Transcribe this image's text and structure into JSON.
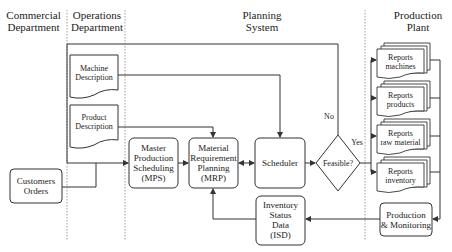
{
  "headers": {
    "commercial": [
      "Commercial",
      "Department"
    ],
    "operations": [
      "Operations",
      "Department"
    ],
    "planning": [
      "Planning",
      "System"
    ],
    "production": [
      "Production",
      "Plant"
    ]
  },
  "documents": {
    "machine": [
      "Machine",
      "Description"
    ],
    "product": [
      "Product",
      "Description"
    ]
  },
  "boxes": {
    "customers": [
      "Customers",
      "Orders"
    ],
    "mps": [
      "Master",
      "Production",
      "Scheduling",
      "(MPS)"
    ],
    "mrp": [
      "Material",
      "Requirement",
      "Planning",
      "(MRP)"
    ],
    "scheduler": "Scheduler",
    "isd": [
      "Inventory",
      "Status",
      "Data",
      "(ISD)"
    ],
    "production_monitoring": [
      "Production",
      "& Monitoring"
    ]
  },
  "decision": {
    "label": "Feasible?",
    "no": "No",
    "yes": "Yes"
  },
  "reports": [
    [
      "Reports",
      "machines"
    ],
    [
      "Reports",
      "products"
    ],
    [
      "Reports",
      "raw material"
    ],
    [
      "Reports",
      "inventory"
    ]
  ],
  "colors": {
    "stroke": "#333333",
    "text": "#222222",
    "separator": "#777777"
  }
}
